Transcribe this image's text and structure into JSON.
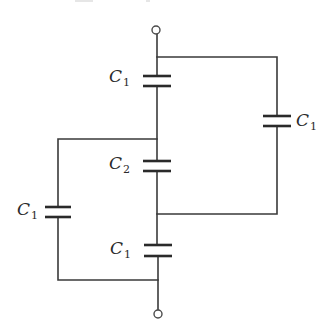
{
  "diagram": {
    "type": "capacitor-network",
    "terminals": [
      {
        "id": "top",
        "cx": 156,
        "cy": 30,
        "r": 4
      },
      {
        "id": "bottom",
        "cx": 158,
        "cy": 314,
        "r": 4
      }
    ],
    "wires": [
      {
        "id": "top-lead",
        "points": [
          [
            157,
            34
          ],
          [
            157,
            76
          ]
        ]
      },
      {
        "id": "top-right-branch",
        "points": [
          [
            157,
            57
          ],
          [
            277,
            57
          ],
          [
            277,
            116
          ]
        ]
      },
      {
        "id": "right-bottom-branch",
        "points": [
          [
            277,
            126
          ],
          [
            277,
            214
          ],
          [
            157,
            214
          ]
        ]
      },
      {
        "id": "c1top-to-c2",
        "points": [
          [
            157,
            86
          ],
          [
            157,
            161
          ]
        ]
      },
      {
        "id": "left-top-branch",
        "points": [
          [
            157,
            139
          ],
          [
            58,
            139
          ],
          [
            58,
            207
          ]
        ]
      },
      {
        "id": "c2-to-c1bottom",
        "points": [
          [
            157,
            171
          ],
          [
            157,
            245
          ]
        ]
      },
      {
        "id": "left-bottom-branch",
        "points": [
          [
            58,
            217
          ],
          [
            58,
            280
          ],
          [
            158,
            280
          ]
        ]
      },
      {
        "id": "bottom-lead",
        "points": [
          [
            158,
            256
          ],
          [
            158,
            310
          ]
        ]
      }
    ],
    "capacitors": [
      {
        "id": "c1-top",
        "x": 157,
        "y1": 76,
        "y2": 86,
        "half_width": 14,
        "label_main": "C",
        "label_sub": "1",
        "label_x": 109,
        "label_y": 68
      },
      {
        "id": "c1-right",
        "x": 277,
        "y1": 116,
        "y2": 126,
        "half_width": 14,
        "label_main": "C",
        "label_sub": "1",
        "label_x": 296,
        "label_y": 112
      },
      {
        "id": "c2-middle",
        "x": 157,
        "y1": 161,
        "y2": 171,
        "half_width": 14,
        "label_main": "C",
        "label_sub": "2",
        "label_x": 109,
        "label_y": 155
      },
      {
        "id": "c1-left",
        "x": 58,
        "y1": 207,
        "y2": 217,
        "half_width": 13,
        "label_main": "C",
        "label_sub": "1",
        "label_x": 17,
        "label_y": 201
      },
      {
        "id": "c1-bottom",
        "x": 158,
        "y1": 245,
        "y2": 256,
        "half_width": 14,
        "label_main": "C",
        "label_sub": "1",
        "label_x": 110,
        "label_y": 240
      }
    ],
    "labels": {
      "c1_top": {
        "main": "C",
        "sub": "1"
      },
      "c1_right": {
        "main": "C",
        "sub": "1"
      },
      "c2_middle": {
        "main": "C",
        "sub": "2"
      },
      "c1_left": {
        "main": "C",
        "sub": "1"
      },
      "c1_bottom": {
        "main": "C",
        "sub": "1"
      }
    }
  }
}
